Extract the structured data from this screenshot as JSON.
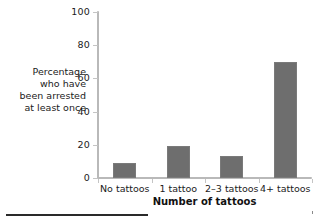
{
  "chart_data": {
    "type": "bar",
    "title": "",
    "subtitle": "",
    "xlabel": "Number of tattoos",
    "ylabel": "Percentage who have been arrested at least once",
    "categories": [
      "No tattoos",
      "1 tattoo",
      "2–3 tattoos",
      "4+ tattoos"
    ],
    "values": [
      9,
      19,
      13,
      70
    ],
    "ylim": [
      0,
      100
    ],
    "yticks": [
      0,
      20,
      40,
      60,
      80,
      100
    ],
    "ytick_labels": [
      "0",
      "20",
      "40",
      "60",
      "80",
      "100"
    ],
    "grid": false,
    "legend": null,
    "annotations": [],
    "bar_color": "#6e6e6e",
    "axis_color": "#b9b9b9",
    "text_color": "#1b1b1b"
  },
  "axis_label_lines": {
    "y": [
      "Percentage",
      "who have",
      "been arrested",
      "at least once"
    ]
  },
  "footer": {
    "rule_color": "#2a2a2a"
  }
}
